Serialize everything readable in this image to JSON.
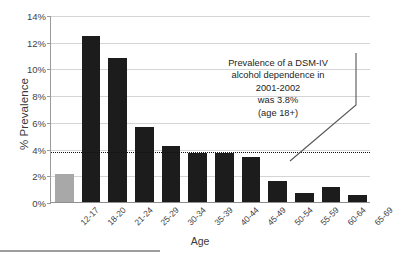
{
  "chart_data": {
    "type": "bar",
    "title": "",
    "subtitle": "",
    "xlabel": "Age",
    "ylabel": "% Prevalence",
    "categories": [
      "12-17",
      "18-20",
      "21-24",
      "25-29",
      "30-34",
      "35-39",
      "40-44",
      "45-49",
      "50-54",
      "55-59",
      "60-64",
      "65-69"
    ],
    "values": [
      2.1,
      12.4,
      10.8,
      5.6,
      4.2,
      3.7,
      3.7,
      3.4,
      1.6,
      0.7,
      1.1,
      0.5
    ],
    "bar_colors": [
      "#a8a8a8",
      "#1c1c1c",
      "#1c1c1c",
      "#1c1c1c",
      "#1c1c1c",
      "#1c1c1c",
      "#1c1c1c",
      "#1c1c1c",
      "#1c1c1c",
      "#1c1c1c",
      "#1c1c1c",
      "#1c1c1c"
    ],
    "ylim": [
      0,
      14
    ],
    "ytick_values": [
      0,
      2,
      4,
      6,
      8,
      10,
      12,
      14
    ],
    "ytick_labels": [
      "0%",
      "2%",
      "4%",
      "6%",
      "8%",
      "10%",
      "12%",
      "14%"
    ],
    "grid": true,
    "grid_axis": "y",
    "legend": false,
    "reference_line": {
      "value": 3.8,
      "style": "dotted",
      "color": "#111111",
      "label": "Prevalence of a DSM-IV alcohol dependence in 2001-2002 was 3.8% (age 18+)"
    },
    "annotations": [
      {
        "lines": [
          "Prevalence of a DSM-IV",
          "alcohol dependence in",
          "2001-2002",
          "was 3.8%",
          "(age 18+)"
        ],
        "points_to": "reference-line"
      }
    ]
  },
  "axes": {
    "y_title": "% Prevalence",
    "x_title": "Age"
  },
  "colors": {
    "bar_dark": "#1c1c1c",
    "bar_gray": "#a8a8a8",
    "gridline": "#d5d5d5",
    "axis": "#9a9a9a",
    "text": "#3f3f3f"
  }
}
